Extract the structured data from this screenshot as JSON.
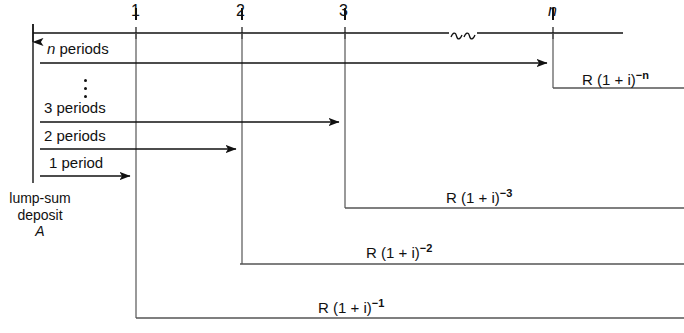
{
  "figure": {
    "type": "cash-flow-timeline-diagram",
    "title_text": "",
    "timeline": {
      "axis_label": "",
      "tick_labels": [
        "1",
        "2",
        "3",
        "n"
      ],
      "tick_x": [
        136,
        242,
        345,
        553
      ],
      "break_symbol": "≀",
      "axis_y": 33,
      "axis_start_x": 33,
      "axis_end_x": 623
    },
    "left_axis": {
      "arrow_label": "",
      "deposit_label_line1": "lump-sum",
      "deposit_label_line2": "deposit",
      "deposit_label_line3": "A"
    },
    "period_rows": [
      {
        "label_prefix": "n",
        "label_rest": " periods",
        "italic_prefix": true,
        "y": 63,
        "end_x": 553
      },
      {
        "label_prefix": "3",
        "label_rest": " periods",
        "italic_prefix": false,
        "y": 122,
        "end_x": 345
      },
      {
        "label_prefix": "2",
        "label_rest": " periods",
        "italic_prefix": false,
        "y": 149,
        "end_x": 242
      },
      {
        "label_prefix": "1",
        "label_rest": " period",
        "italic_prefix": false,
        "y": 176,
        "end_x": 136
      }
    ],
    "ellipsis_marker": "⋮",
    "flows": [
      {
        "base": "R (1 + i)",
        "exponent": "−n",
        "label_x": 582,
        "label_y": 70,
        "bend_x": 553,
        "bend_y": 88
      },
      {
        "base": "R (1 + i)",
        "exponent": "−3",
        "label_x": 446,
        "label_y": 188,
        "bend_x": 345,
        "bend_y": 208
      },
      {
        "base": "R (1 + i)",
        "exponent": "−2",
        "label_x": 366,
        "label_y": 243,
        "bend_x": 240,
        "bend_y": 264
      },
      {
        "base": "R (1 + i)",
        "exponent": "−1",
        "label_x": 318,
        "label_y": 298,
        "bend_x": 136,
        "bend_y": 318
      }
    ],
    "colors": {
      "ink": "#111111",
      "background": "#ffffff"
    }
  }
}
